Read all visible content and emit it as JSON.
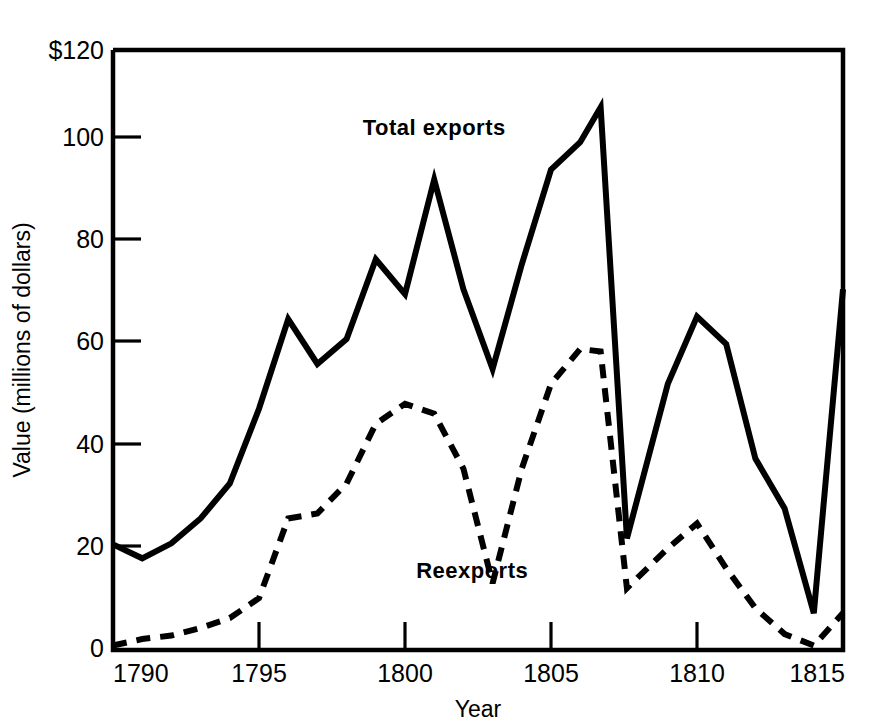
{
  "chart_data": {
    "type": "line",
    "title": "",
    "xlabel": "Year",
    "ylabel": "Value (millions of dollars)",
    "xlim": [
      1790,
      1815
    ],
    "ylim": [
      0,
      120
    ],
    "grid": false,
    "legend_position": "inline-annotations",
    "x_ticks": [
      "1790",
      "1795",
      "1800",
      "1805",
      "1810",
      "1815"
    ],
    "x_tick_values": [
      1790,
      1795,
      1800,
      1805,
      1810,
      1815
    ],
    "y_ticks": [
      "$120",
      "100",
      "80",
      "60",
      "40",
      "20",
      "0"
    ],
    "y_tick_values": [
      120,
      100,
      80,
      60,
      40,
      20,
      0
    ],
    "annotations": [
      {
        "text": "Total exports",
        "x": 1801,
        "y": 103,
        "series": "Total exports"
      },
      {
        "text": "Reexports",
        "x": 1802.3,
        "y": 14,
        "series": "Reexports"
      }
    ],
    "x": [
      1790,
      1791,
      1792,
      1793,
      1794,
      1795,
      1796,
      1797,
      1798,
      1799,
      1800,
      1801,
      1802,
      1803,
      1804,
      1805,
      1806,
      1806.7,
      1807.6,
      1809,
      1810,
      1811,
      1812,
      1813,
      1814,
      1815
    ],
    "series": [
      {
        "name": "Total exports",
        "style": "solid",
        "values": [
          20.8,
          18.0,
          21.0,
          26.0,
          33.0,
          48.0,
          66.0,
          57.0,
          62.0,
          78.0,
          71.0,
          94.0,
          72.0,
          56.0,
          77.0,
          96.0,
          101.5,
          108.5,
          22.0,
          53.0,
          66.5,
          61.0,
          38.0,
          28.0,
          7.0,
          72.0
        ]
      },
      {
        "name": "Reexports",
        "style": "dashed",
        "values": [
          0.5,
          1.8,
          2.5,
          4.0,
          6.0,
          10.0,
          26.0,
          27.0,
          33.0,
          45.0,
          49.0,
          47.0,
          36.0,
          13.0,
          36.0,
          53.0,
          60.0,
          59.5,
          12.0,
          20.0,
          25.0,
          16.0,
          8.0,
          2.8,
          0.5,
          7.0
        ]
      }
    ]
  },
  "geometry": {
    "x_left_px": 113,
    "x_right_px": 843,
    "y_zero_px": 648,
    "y_top_px": 50
  }
}
